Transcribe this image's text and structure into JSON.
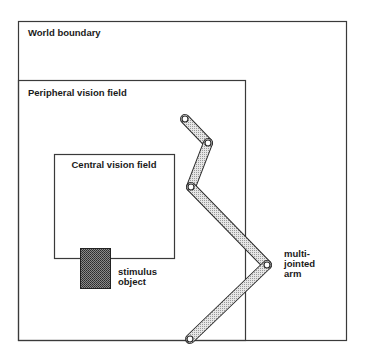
{
  "diagram": {
    "regions": {
      "world": {
        "label": "World boundary",
        "x": 18,
        "y": 21,
        "w": 328,
        "h": 319
      },
      "peripheral": {
        "label": "Peripheral vision field",
        "x": 18,
        "y": 80,
        "w": 227,
        "h": 260
      },
      "central": {
        "label": "Central vision field",
        "x": 54,
        "y": 154,
        "w": 120,
        "h": 104
      }
    },
    "stimulus": {
      "label_line1": "stimulus",
      "label_line2": "object",
      "x": 80,
      "y": 248,
      "w": 30,
      "h": 40
    },
    "arm": {
      "label_line1": "multi-",
      "label_line2": "jointed",
      "label_line3": "arm",
      "joints": [
        [
          185,
          119
        ],
        [
          208,
          143
        ],
        [
          191,
          187
        ],
        [
          267,
          265
        ],
        [
          190,
          339
        ]
      ]
    },
    "colors": {
      "line": "#3a3a3a",
      "arm_fill": "#d4d4d4",
      "stimulus_fill": "#6a6a6a"
    }
  }
}
